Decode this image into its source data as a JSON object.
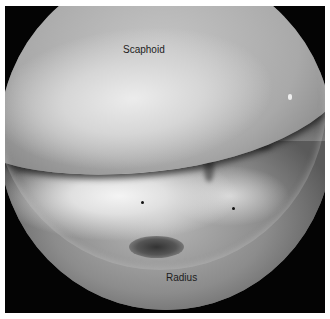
{
  "image": {
    "description": "Arthroscopic view of the wrist joint showing scaphoid and radius",
    "labels": {
      "upper": "Scaphoid",
      "lower": "Radius"
    },
    "markers": [
      {
        "name": "marker-dot-left",
        "x": 142,
        "y": 202
      },
      {
        "name": "marker-dot-right",
        "x": 232,
        "y": 208
      }
    ],
    "colors": {
      "background": "#040404",
      "border": "#ffffff",
      "label_text": "#1c1c1c"
    }
  }
}
